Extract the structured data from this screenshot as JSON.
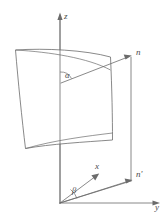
{
  "figure": {
    "background_color": "#ffffff",
    "line_color": "#6b6b6b",
    "label_color": "#4a4a4a",
    "labels": {
      "z_axis": "z",
      "y_axis": "y",
      "x_axis": "x",
      "normal_vector": "n",
      "normal_projection": "n'",
      "angle_alpha": "α",
      "angle_beta": "β"
    },
    "elements": {
      "z_axis_name": "vertical z axis with arrowhead pointing up",
      "y_axis_name": "horizontal y axis with arrowhead pointing right",
      "x_axis_name": "x axis with arrowhead pointing up-right",
      "surface_name": "curved quadrilateral surface patch",
      "normal_name": "normal vector n from origin point on surface",
      "projection_name": "projected normal n' in horizontal plane",
      "vertical_plane_name": "vertical reference plane rectangle"
    }
  }
}
